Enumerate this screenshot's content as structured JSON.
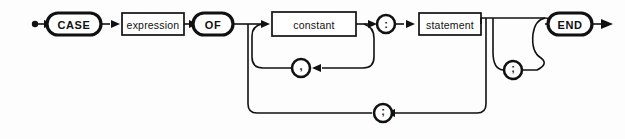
{
  "diagram": {
    "kind": "railroad-syntax-diagram",
    "background_color": "#fdfdfd",
    "ink_color": "#111111",
    "start": {
      "name": "entry-point",
      "marker": "filled-dot"
    },
    "end": {
      "name": "exit-point",
      "marker": "arrowhead"
    },
    "terminals": [
      {
        "id": "case",
        "label": "CASE",
        "shape": "oval",
        "cx": 74,
        "cy": 24,
        "rx": 27,
        "ry": 11
      },
      {
        "id": "of",
        "label": "OF",
        "shape": "oval",
        "cx": 213,
        "cy": 24,
        "rx": 20,
        "ry": 11
      },
      {
        "id": "end",
        "label": "END",
        "shape": "oval",
        "cx": 570,
        "cy": 24,
        "rx": 22,
        "ry": 11
      }
    ],
    "nonterminals": [
      {
        "id": "expression",
        "label": "expression",
        "shape": "rect",
        "x": 122,
        "y": 13,
        "w": 62,
        "h": 22
      },
      {
        "id": "constant",
        "label": "constant",
        "shape": "rect",
        "x": 272,
        "y": 12,
        "w": 84,
        "h": 24
      },
      {
        "id": "statement",
        "label": "statement",
        "shape": "rect",
        "x": 419,
        "y": 13,
        "w": 62,
        "h": 22
      }
    ],
    "punctuation": [
      {
        "id": "comma-separator",
        "label": ",",
        "shape": "circle",
        "cx": 301,
        "cy": 68,
        "r": 9,
        "role": "constant-list-separator"
      },
      {
        "id": "colon-separator",
        "label": ":",
        "shape": "circle",
        "cx": 386,
        "cy": 24,
        "r": 9,
        "role": "constant-statement-separator"
      },
      {
        "id": "semicolon-optional",
        "label": ";",
        "shape": "circle",
        "cx": 513,
        "cy": 70,
        "r": 9,
        "role": "optional-trailing-semicolon"
      },
      {
        "id": "semicolon-case-separator",
        "label": ";",
        "shape": "circle",
        "cx": 383,
        "cy": 113,
        "r": 9,
        "role": "case-element-separator"
      }
    ],
    "loops": [
      {
        "id": "constant-loop",
        "separator": ",",
        "description": "repeat constant separated by comma"
      },
      {
        "id": "case-element-loop",
        "separator": ";",
        "description": "repeat case element separated by semicolon"
      },
      {
        "id": "trailing-semicolon-loop",
        "separator": ";",
        "description": "optional semicolon before END"
      }
    ],
    "grammar_sequence": [
      "CASE",
      "expression",
      "OF",
      "constant",
      ":",
      "statement",
      "END"
    ]
  }
}
